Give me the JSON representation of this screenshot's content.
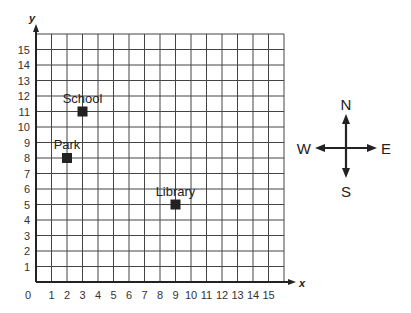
{
  "chart_data": {
    "type": "scatter",
    "title": "",
    "xlabel": "x",
    "ylabel": "y",
    "xlim": [
      0,
      16
    ],
    "ylim": [
      0,
      16
    ],
    "grid": true,
    "origin_label": "0",
    "x_ticks": [
      "1",
      "2",
      "3",
      "4",
      "5",
      "6",
      "7",
      "8",
      "9",
      "10",
      "11",
      "12",
      "13",
      "14",
      "15"
    ],
    "y_ticks": [
      "1",
      "2",
      "3",
      "4",
      "5",
      "6",
      "7",
      "8",
      "9",
      "10",
      "11",
      "12",
      "13",
      "14",
      "15"
    ],
    "points": [
      {
        "label": "School",
        "x": 3,
        "y": 11
      },
      {
        "label": "Park",
        "x": 2,
        "y": 8
      },
      {
        "label": "Library",
        "x": 9,
        "y": 5
      }
    ],
    "marker_color": "#222222"
  },
  "compass": {
    "north": "N",
    "south": "S",
    "east": "E",
    "west": "W"
  }
}
